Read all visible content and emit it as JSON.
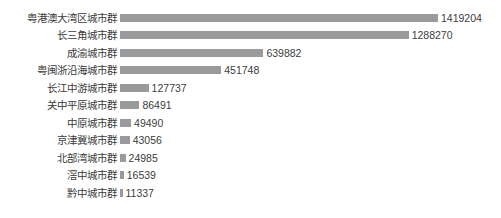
{
  "chart_data": {
    "type": "bar",
    "orientation": "horizontal",
    "title": "",
    "subtitle": "",
    "xlabel": "",
    "ylabel": "",
    "grid": false,
    "legend": false,
    "axis_visible": false,
    "bar_color": "#9a9a9a",
    "label_color": "#3b3b3b",
    "background": "#ffffff",
    "xlim": [
      0,
      1419204
    ],
    "categories": [
      "粤港澳大湾区城市群",
      "长三角城市群",
      "成渝城市群",
      "粤闽浙沿海城市群",
      "长江中游城市群",
      "关中平原城市群",
      "中原城市群",
      "京津冀城市群",
      "北部湾城市群",
      "滘中城市群",
      "黔中城市群"
    ],
    "values": [
      1419204,
      1288270,
      639882,
      451748,
      127737,
      86491,
      49490,
      43056,
      24985,
      16539,
      11337
    ],
    "value_labels": [
      "1419204",
      "1288270",
      "639882",
      "451748",
      "127737",
      "86491",
      "49490",
      "43056",
      "24985",
      "16539",
      "11337"
    ]
  }
}
